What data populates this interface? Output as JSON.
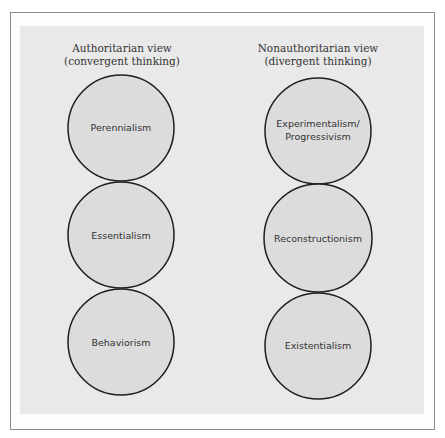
{
  "colors": {
    "background": "#ffffff",
    "frame_border": "#8a8a8a",
    "panel": "#e9e9e9",
    "circle_fill": "#dcdcdc",
    "circle_stroke": "#1e1e1e",
    "text": "#333333"
  },
  "columns": [
    {
      "heading_line1": "Authoritarian view",
      "heading_line2": "(convergent thinking)",
      "circles": [
        {
          "label": "Perennialism"
        },
        {
          "label": "Essentialism"
        },
        {
          "label": "Behaviorism"
        }
      ]
    },
    {
      "heading_line1": "Nonauthoritarian view",
      "heading_line2": "(divergent thinking)",
      "circles": [
        {
          "label_line1": "Experimentalism/",
          "label_line2": "Progressivism"
        },
        {
          "label": "Reconstructionism"
        },
        {
          "label": "Existentialism"
        }
      ]
    }
  ]
}
